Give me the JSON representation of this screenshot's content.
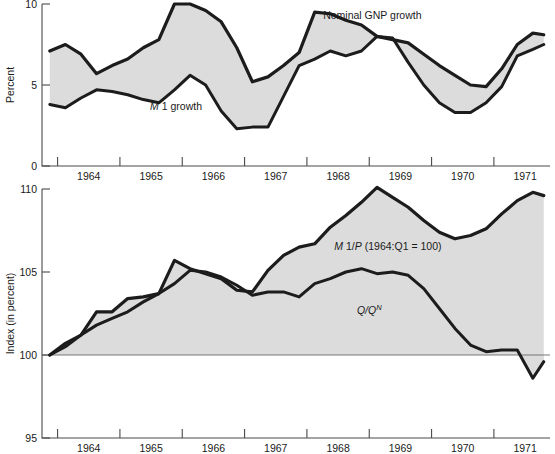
{
  "figure": {
    "background": "#ffffff",
    "band_color": "#dcdcdc",
    "line_color": "#1c1c1c",
    "axis_color": "#4a4a4a"
  },
  "chart_data": [
    {
      "id": "top",
      "type": "area",
      "title": "",
      "xlabel": "",
      "ylabel": "Percent",
      "ylim": [
        0,
        10
      ],
      "yticks": [
        0,
        5,
        10
      ],
      "ytick_labels": [
        "0",
        "5",
        "10"
      ],
      "xlim": [
        1963.75,
        1971.9
      ],
      "xticks": [
        1964,
        1965,
        1966,
        1967,
        1968,
        1969,
        1970,
        1971,
        1972
      ],
      "xtick_labels": [
        "1964",
        "1965",
        "1966",
        "1967",
        "1968",
        "1969",
        "1970",
        "1971"
      ],
      "grid": false,
      "legend_position": "inline-annotation",
      "annotations": [
        {
          "name": "nominal-gnp-growth-label",
          "text": "Nominal GNP growth",
          "x": 1969.05,
          "y": 9.05
        },
        {
          "name": "m1-growth-label",
          "text_italic": "M",
          "text": " 1 growth",
          "x": 1965.9,
          "y": 3.45
        }
      ],
      "series": [
        {
          "name": "Nominal GNP growth",
          "x": [
            1963.875,
            1964.125,
            1964.375,
            1964.625,
            1964.875,
            1965.125,
            1965.375,
            1965.625,
            1965.875,
            1966.125,
            1966.375,
            1966.625,
            1966.875,
            1967.125,
            1967.375,
            1967.625,
            1967.875,
            1968.125,
            1968.375,
            1968.625,
            1968.875,
            1969.125,
            1969.375,
            1969.625,
            1969.875,
            1970.125,
            1970.375,
            1970.625,
            1970.875,
            1971.125,
            1971.375,
            1971.625,
            1971.8
          ],
          "values": [
            7.1,
            7.5,
            6.9,
            5.7,
            6.2,
            6.6,
            7.3,
            7.8,
            10.0,
            10.0,
            9.6,
            8.9,
            7.3,
            5.2,
            5.5,
            6.2,
            7.0,
            9.5,
            9.4,
            9.0,
            8.7,
            8.0,
            7.8,
            7.6,
            6.9,
            6.2,
            5.6,
            5.0,
            4.9,
            6.0,
            7.5,
            8.2,
            8.1,
            9.6
          ]
        },
        {
          "name": "M 1 growth",
          "x": [
            1963.875,
            1964.125,
            1964.375,
            1964.625,
            1964.875,
            1965.125,
            1965.375,
            1965.625,
            1965.875,
            1966.125,
            1966.375,
            1966.625,
            1966.875,
            1967.125,
            1967.375,
            1967.625,
            1967.875,
            1968.125,
            1968.375,
            1968.625,
            1968.875,
            1969.125,
            1969.375,
            1969.625,
            1969.875,
            1970.125,
            1970.375,
            1970.625,
            1970.875,
            1971.125,
            1971.375,
            1971.625,
            1971.8
          ],
          "values": [
            3.8,
            3.6,
            4.2,
            4.7,
            4.6,
            4.4,
            4.1,
            3.9,
            4.7,
            5.6,
            5.0,
            3.4,
            2.3,
            2.4,
            2.4,
            4.3,
            6.2,
            6.6,
            7.1,
            6.8,
            7.1,
            8.0,
            7.9,
            6.4,
            5.0,
            3.9,
            3.3,
            3.3,
            3.9,
            4.9,
            6.8,
            7.2,
            7.5,
            6.9
          ]
        }
      ]
    },
    {
      "id": "bottom",
      "type": "area",
      "title": "",
      "xlabel": "",
      "ylabel": "Index (in percent)",
      "ylim": [
        95,
        110
      ],
      "yticks": [
        95,
        100,
        105,
        110
      ],
      "ytick_labels": [
        "95",
        "100",
        "105",
        "110"
      ],
      "xlim": [
        1963.75,
        1971.9
      ],
      "xticks": [
        1964,
        1965,
        1966,
        1967,
        1968,
        1969,
        1970,
        1971,
        1972
      ],
      "xtick_labels": [
        "1964",
        "1965",
        "1966",
        "1967",
        "1968",
        "1969",
        "1970",
        "1971"
      ],
      "baseline": 100,
      "grid": false,
      "legend_position": "inline-annotation",
      "annotations": [
        {
          "name": "m1-over-p-label",
          "text_italic": "M",
          "text": " 1/",
          "text_italic2": "P",
          "text2": " (1964:Q1 = 100)",
          "x": 1969.3,
          "y": 106.3
        },
        {
          "name": "q-over-qn-label",
          "text_italic": "Q/Q",
          "sup": "N",
          "x": 1969.0,
          "y": 102.5
        }
      ],
      "series": [
        {
          "name": "M 1/P (1964:Q1 = 100)",
          "x": [
            1963.875,
            1964.125,
            1964.375,
            1964.625,
            1964.875,
            1965.125,
            1965.375,
            1965.625,
            1965.875,
            1966.125,
            1966.375,
            1966.625,
            1966.875,
            1967.125,
            1967.375,
            1967.625,
            1967.875,
            1968.125,
            1968.375,
            1968.625,
            1968.875,
            1969.125,
            1969.375,
            1969.625,
            1969.875,
            1970.125,
            1970.375,
            1970.625,
            1970.875,
            1971.125,
            1971.375,
            1971.625,
            1971.8
          ],
          "values": [
            100.0,
            100.7,
            101.2,
            102.6,
            102.6,
            103.4,
            103.5,
            103.7,
            105.7,
            105.2,
            104.9,
            104.6,
            103.9,
            103.8,
            105.1,
            106.0,
            106.5,
            106.7,
            107.7,
            108.4,
            109.2,
            110.1,
            109.5,
            108.9,
            108.1,
            107.4,
            107.0,
            107.2,
            107.6,
            108.5,
            109.3,
            109.8,
            109.6,
            109.5
          ]
        },
        {
          "name": "Q/Q^N",
          "x": [
            1963.875,
            1964.125,
            1964.375,
            1964.625,
            1964.875,
            1965.125,
            1965.375,
            1965.625,
            1965.875,
            1966.125,
            1966.375,
            1966.625,
            1966.875,
            1967.125,
            1967.375,
            1967.625,
            1967.875,
            1968.125,
            1968.375,
            1968.625,
            1968.875,
            1969.125,
            1969.375,
            1969.625,
            1969.875,
            1970.125,
            1970.375,
            1970.625,
            1970.875,
            1971.125,
            1971.375,
            1971.625,
            1971.8
          ],
          "values": [
            100.0,
            100.5,
            101.2,
            101.8,
            102.2,
            102.6,
            103.2,
            103.7,
            104.3,
            105.1,
            105.0,
            104.7,
            104.2,
            103.6,
            103.8,
            103.8,
            103.5,
            104.3,
            104.6,
            105.0,
            105.2,
            104.9,
            105.0,
            104.8,
            104.0,
            102.8,
            101.6,
            100.6,
            100.2,
            100.3,
            100.3,
            98.6,
            99.6,
            99.1,
            99.4,
            99.5,
            100.0
          ]
        }
      ]
    }
  ]
}
